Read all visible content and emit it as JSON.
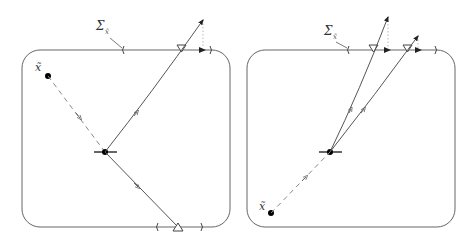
{
  "figure": {
    "colors": {
      "stroke": "#555555",
      "dashed": "#888888",
      "dotted": "#bbbbbb",
      "point": "#000000"
    }
  },
  "panels": [
    {
      "id": "left",
      "sigma_label": "Σ",
      "sigma_sub": "x̃",
      "point_label": "x̃"
    },
    {
      "id": "right",
      "sigma_label": "Σ",
      "sigma_sub": "x̃",
      "point_label": "x̃"
    }
  ]
}
